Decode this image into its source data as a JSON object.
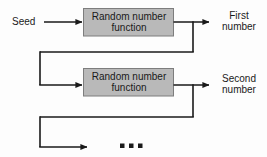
{
  "diagram": {
    "background_color": "#fdfdfd",
    "box_fill_color": "#b9b9b9",
    "box_border_color": "#7d7d7d",
    "line_color": "#1a1a1a",
    "text_color": "#1a1a1a",
    "input": {
      "label": "Seed"
    },
    "stages": [
      {
        "id": "stage-1",
        "box_line_1": "Random number",
        "box_line_2": "function",
        "output_line_1": "First",
        "output_line_2": "number"
      },
      {
        "id": "stage-2",
        "box_line_1": "Random number",
        "box_line_2": "function",
        "output_line_1": "Second",
        "output_line_2": "number"
      }
    ],
    "continuation": {
      "label": "...",
      "dot_count": 3
    }
  }
}
